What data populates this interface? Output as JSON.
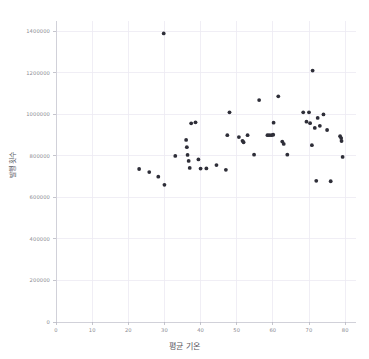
{
  "chart_data": {
    "type": "scatter",
    "title": "",
    "xlabel": "평균 기온",
    "ylabel": "발행 횟수",
    "xlim": [
      0,
      83
    ],
    "ylim": [
      0,
      1450000
    ],
    "xticks": [
      0,
      10,
      20,
      30,
      40,
      50,
      60,
      70,
      80
    ],
    "xticklabels": [
      "0",
      "10",
      "20",
      "30",
      "40",
      "50",
      "60",
      "70",
      "80"
    ],
    "yticks": [
      0,
      200000,
      400000,
      600000,
      800000,
      1000000,
      1200000,
      1400000
    ],
    "yticklabels": [
      "0",
      "200000",
      "400000",
      "600000",
      "800000",
      "1000000",
      "1200000",
      "1400000"
    ],
    "grid": true,
    "legend": null,
    "marker": {
      "shape": "circle",
      "color": "#2e2e38",
      "size": 2.6
    },
    "points": [
      {
        "x": 23.0,
        "y": 737000
      },
      {
        "x": 25.8,
        "y": 722000
      },
      {
        "x": 28.3,
        "y": 700000
      },
      {
        "x": 29.8,
        "y": 1390000
      },
      {
        "x": 30.0,
        "y": 661000
      },
      {
        "x": 33.0,
        "y": 800000
      },
      {
        "x": 36.0,
        "y": 877000
      },
      {
        "x": 36.2,
        "y": 842000
      },
      {
        "x": 36.4,
        "y": 805000
      },
      {
        "x": 36.7,
        "y": 776000
      },
      {
        "x": 37.0,
        "y": 742000
      },
      {
        "x": 37.4,
        "y": 957000
      },
      {
        "x": 38.6,
        "y": 962000
      },
      {
        "x": 39.4,
        "y": 783000
      },
      {
        "x": 40.0,
        "y": 739000
      },
      {
        "x": 41.6,
        "y": 740000
      },
      {
        "x": 44.4,
        "y": 756000
      },
      {
        "x": 47.0,
        "y": 733000
      },
      {
        "x": 47.4,
        "y": 900000
      },
      {
        "x": 48.0,
        "y": 1010000
      },
      {
        "x": 50.6,
        "y": 891000
      },
      {
        "x": 51.6,
        "y": 873000
      },
      {
        "x": 51.9,
        "y": 866000
      },
      {
        "x": 53.0,
        "y": 900000
      },
      {
        "x": 54.8,
        "y": 806000
      },
      {
        "x": 56.2,
        "y": 1069000
      },
      {
        "x": 58.5,
        "y": 900000
      },
      {
        "x": 59.0,
        "y": 900000
      },
      {
        "x": 59.6,
        "y": 900000
      },
      {
        "x": 60.1,
        "y": 902000
      },
      {
        "x": 60.2,
        "y": 960000
      },
      {
        "x": 61.5,
        "y": 1087000
      },
      {
        "x": 62.6,
        "y": 869000
      },
      {
        "x": 63.0,
        "y": 858000
      },
      {
        "x": 64.0,
        "y": 806000
      },
      {
        "x": 68.4,
        "y": 1010000
      },
      {
        "x": 69.3,
        "y": 965000
      },
      {
        "x": 70.0,
        "y": 1010000
      },
      {
        "x": 70.3,
        "y": 958000
      },
      {
        "x": 70.8,
        "y": 852000
      },
      {
        "x": 71.0,
        "y": 1211000
      },
      {
        "x": 71.6,
        "y": 935000
      },
      {
        "x": 72.0,
        "y": 680000
      },
      {
        "x": 72.4,
        "y": 983000
      },
      {
        "x": 73.0,
        "y": 945000
      },
      {
        "x": 74.0,
        "y": 1000000
      },
      {
        "x": 75.0,
        "y": 925000
      },
      {
        "x": 76.0,
        "y": 678000
      },
      {
        "x": 78.6,
        "y": 895000
      },
      {
        "x": 78.9,
        "y": 886000
      },
      {
        "x": 79.0,
        "y": 872000
      },
      {
        "x": 79.3,
        "y": 795000
      }
    ]
  }
}
